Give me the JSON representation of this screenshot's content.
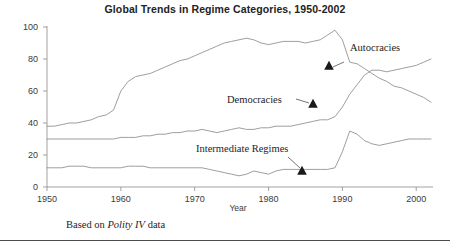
{
  "chart_data": {
    "type": "line",
    "title": "Global Trends in Regime Categories, 1950-2002",
    "xlabel": "Year",
    "ylabel": "",
    "xlim": [
      1950,
      2002
    ],
    "ylim": [
      0,
      100
    ],
    "grid": false,
    "legend_position": "inline-annotations",
    "xticks": [
      1950,
      1960,
      1970,
      1980,
      1990,
      2000
    ],
    "yticks": [
      0,
      20,
      40,
      60,
      80,
      100
    ],
    "x": [
      1950,
      1951,
      1952,
      1953,
      1954,
      1955,
      1956,
      1957,
      1958,
      1959,
      1960,
      1961,
      1962,
      1963,
      1964,
      1965,
      1966,
      1967,
      1968,
      1969,
      1970,
      1971,
      1972,
      1973,
      1974,
      1975,
      1976,
      1977,
      1978,
      1979,
      1980,
      1981,
      1982,
      1983,
      1984,
      1985,
      1986,
      1987,
      1988,
      1989,
      1990,
      1991,
      1992,
      1993,
      1994,
      1995,
      1996,
      1997,
      1998,
      1999,
      2000,
      2001,
      2002
    ],
    "series": [
      {
        "name": "Autocracies",
        "values": [
          38,
          38,
          39,
          40,
          40,
          41,
          42,
          44,
          45,
          48,
          60,
          66,
          69,
          70,
          71,
          73,
          75,
          77,
          79,
          80,
          82,
          84,
          86,
          88,
          90,
          91,
          92,
          93,
          92,
          90,
          89,
          90,
          91,
          91,
          91,
          90,
          91,
          92,
          95,
          98,
          92,
          78,
          77,
          74,
          71,
          68,
          66,
          63,
          62,
          60,
          58,
          56,
          53
        ]
      },
      {
        "name": "Democracies",
        "values": [
          30,
          30,
          30,
          30,
          30,
          30,
          30,
          30,
          30,
          30,
          31,
          31,
          31,
          32,
          32,
          33,
          33,
          34,
          34,
          35,
          35,
          36,
          35,
          34,
          35,
          36,
          37,
          36,
          36,
          37,
          37,
          38,
          38,
          38,
          39,
          40,
          41,
          42,
          42,
          44,
          50,
          58,
          64,
          70,
          73,
          73,
          72,
          73,
          74,
          75,
          76,
          78,
          80
        ]
      },
      {
        "name": "Intermediate Regimes",
        "values": [
          12,
          12,
          12,
          13,
          13,
          13,
          12,
          12,
          12,
          12,
          12,
          13,
          13,
          13,
          12,
          12,
          12,
          12,
          12,
          12,
          12,
          12,
          11,
          10,
          9,
          8,
          7,
          8,
          10,
          9,
          8,
          10,
          11,
          11,
          11,
          11,
          11,
          11,
          11,
          12,
          22,
          35,
          33,
          29,
          27,
          26,
          27,
          28,
          29,
          30,
          30,
          30,
          30
        ]
      }
    ],
    "annotations": [
      {
        "label": "Autocracies",
        "series": "Autocracies"
      },
      {
        "label": "Democracies",
        "series": "Democracies"
      },
      {
        "label": "Intermediate Regimes",
        "series": "Intermediate Regimes"
      }
    ]
  },
  "caption": {
    "prefix": "Based on ",
    "italic": "Polity IV",
    "suffix": " data"
  }
}
